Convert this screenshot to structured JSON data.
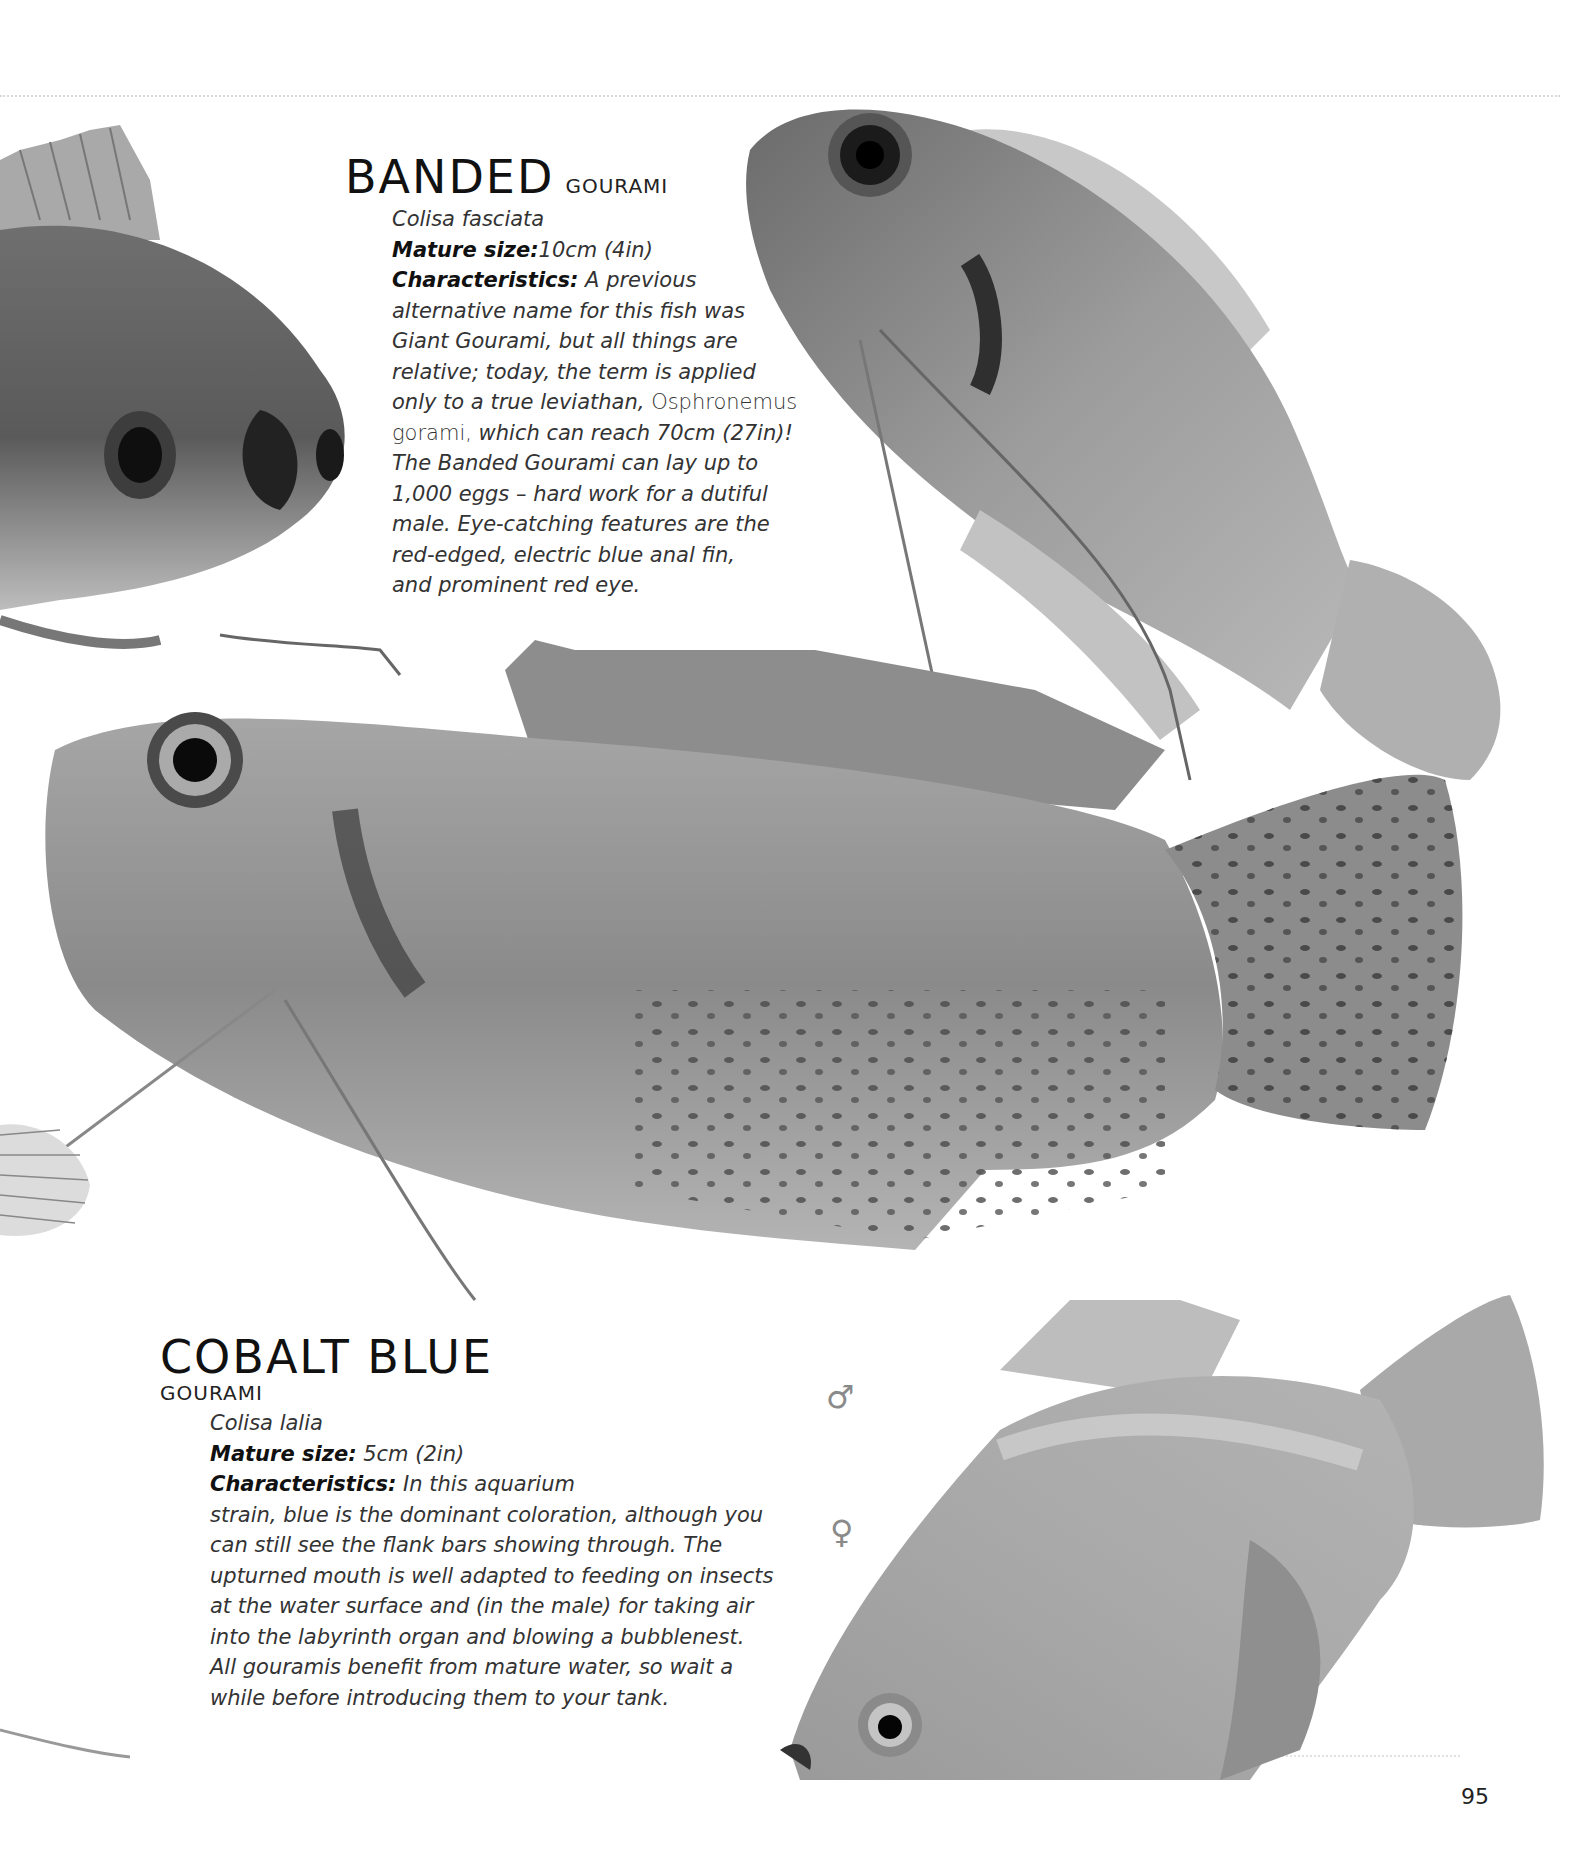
{
  "page": {
    "number": "95"
  },
  "species": [
    {
      "name_main": "BANDED",
      "name_sub": "GOURAMI",
      "scientific_name": "Colisa fasciata",
      "mature_size_label": "Mature size:",
      "mature_size_value": "10cm (4in)",
      "characteristics_label": "Characteristics:",
      "characteristics_lines": [
        " A previous",
        "alternative name for this fish was",
        "Giant Gourami, but all things are",
        "relative; today, the term is applied",
        "only to a true leviathan, ",
        "gorami,",
        " which can reach 70cm (27in)!",
        "The Banded Gourami can lay up to",
        "1,000 eggs – hard work for a dutiful",
        "male. Eye-catching features are the",
        "red-edged, electric blue anal fin,",
        "and prominent red eye."
      ],
      "roman_term": "Osphronemus"
    },
    {
      "name_main": "COBALT BLUE",
      "name_sub": "GOURAMI",
      "scientific_name": "Colisa lalia",
      "mature_size_label": "Mature size:",
      "mature_size_value": " 5cm (2in)",
      "characteristics_label": "Characteristics:",
      "characteristics_lines": [
        " In this aquarium",
        "strain, blue is the dominant coloration, although you",
        "can still see the flank bars showing through. The",
        "upturned mouth is well adapted to feeding on insects",
        "at the water surface and (in the male) for taking air",
        "into the labyrinth organ and blowing a bubblenest.",
        "All gouramis benefit from mature water, so wait a",
        "while before introducing them to your tank."
      ]
    }
  ],
  "sex_symbols": {
    "male": "♂",
    "female": "♀"
  },
  "images": [
    {
      "subject": "banded-gourami-head-left"
    },
    {
      "subject": "banded-gourami-top-right"
    },
    {
      "subject": "banded-gourami-center-large"
    },
    {
      "subject": "cobalt-blue-gourami-bottom-right"
    }
  ],
  "colors": {
    "background": "#ffffff",
    "text": "#333333",
    "heading": "#111111",
    "sex_symbol": "#8a8a8a"
  }
}
